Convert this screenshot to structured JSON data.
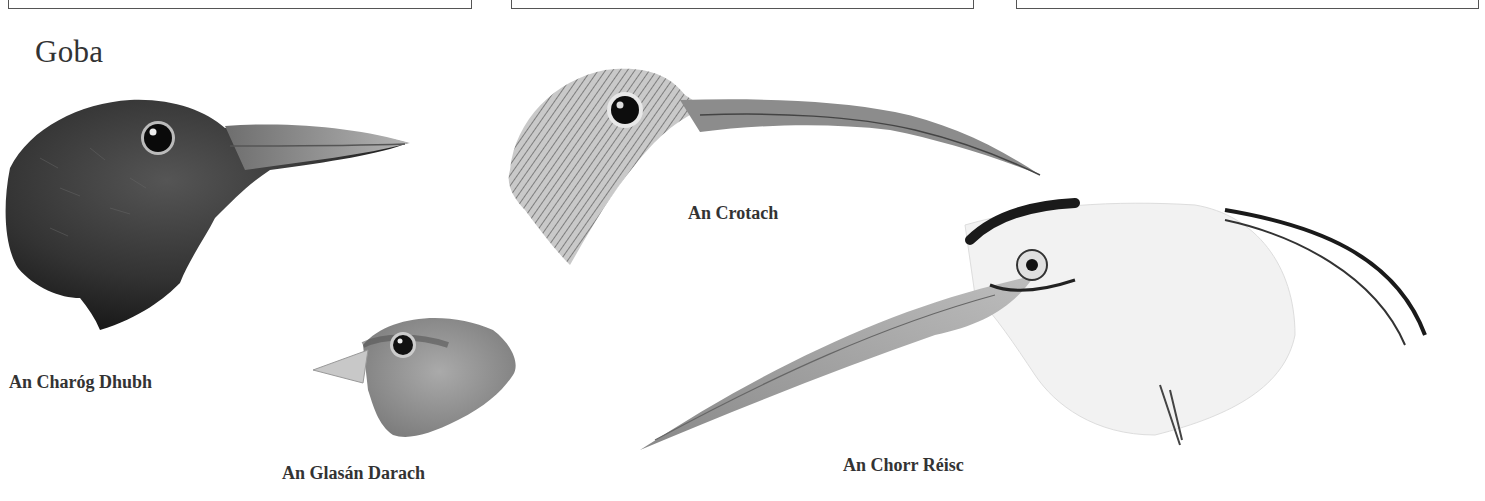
{
  "page": {
    "title": "Goba"
  },
  "top_boxes": [
    {
      "left": 8,
      "width": 462
    },
    {
      "left": 511,
      "width": 461
    },
    {
      "left": 1016,
      "width": 461
    }
  ],
  "illustrations": [
    {
      "id": "blackbird",
      "caption": "An Charóg Dhubh",
      "shade": "dark"
    },
    {
      "id": "chaffinch",
      "caption": "An Glasán Darach",
      "shade": "mid"
    },
    {
      "id": "curlew",
      "caption": "An Crotach",
      "shade": "streaked"
    },
    {
      "id": "heron",
      "caption": "An Chorr Réisc",
      "shade": "light"
    }
  ],
  "colors": {
    "ink": "#2a2a2a",
    "dark_plumage": "#1e1e1e",
    "mid_plumage": "#8a8a8a",
    "light_plumage": "#e6e6e6",
    "beak": "#9a9a9a"
  }
}
